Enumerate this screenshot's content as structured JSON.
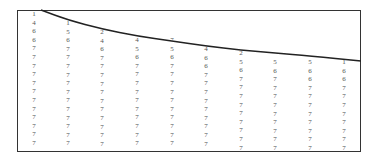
{
  "diagram": {
    "type": "number-grid-with-boundary-curve",
    "frame": {
      "left": 17,
      "top": 10,
      "right": 361,
      "bottom": 152
    },
    "curve_points": [
      [
        41,
        10
      ],
      [
        68,
        20
      ],
      [
        102,
        29
      ],
      [
        137,
        36
      ],
      [
        172,
        41
      ],
      [
        206,
        46
      ],
      [
        241,
        50
      ],
      [
        275,
        53
      ],
      [
        310,
        56
      ],
      [
        361,
        61
      ]
    ],
    "row_spacing": 8.6,
    "columns": [
      {
        "x": 34,
        "start_y": 14,
        "values": [
          "1",
          "4",
          "6",
          "6",
          "7",
          "7",
          "7",
          "7",
          "7",
          "7",
          "7",
          "7",
          "7",
          "7",
          "7",
          "7"
        ]
      },
      {
        "x": 68,
        "start_y": 23,
        "values": [
          "1",
          "5",
          "6",
          "7",
          "7",
          "7",
          "7",
          "7",
          "7",
          "7",
          "7",
          "7",
          "7",
          "7",
          "7"
        ]
      },
      {
        "x": 102,
        "start_y": 32,
        "values": [
          "2",
          "4",
          "6",
          "7",
          "7",
          "7",
          "7",
          "7",
          "7",
          "7",
          "7",
          "7",
          "7",
          "7"
        ]
      },
      {
        "x": 137,
        "start_y": 40,
        "values": [
          "4",
          "5",
          "6",
          "7",
          "7",
          "7",
          "7",
          "7",
          "7",
          "7",
          "7",
          "7",
          "7"
        ]
      },
      {
        "x": 172,
        "start_y": 40,
        "values": [
          "7",
          "5",
          "6",
          "7",
          "7",
          "7",
          "7",
          "7",
          "7",
          "7",
          "7",
          "7",
          "7"
        ]
      },
      {
        "x": 206,
        "start_y": 49,
        "values": [
          "4",
          "6",
          "6",
          "7",
          "7",
          "7",
          "7",
          "7",
          "7",
          "7",
          "7",
          "7"
        ]
      },
      {
        "x": 241,
        "start_y": 53,
        "values": [
          "2",
          "5",
          "6",
          "7",
          "7",
          "7",
          "7",
          "7",
          "7",
          "7",
          "7",
          "7"
        ]
      },
      {
        "x": 275,
        "start_y": 62,
        "values": [
          "5",
          "6",
          "7",
          "7",
          "7",
          "7",
          "7",
          "7",
          "7",
          "7",
          "7"
        ]
      },
      {
        "x": 310,
        "start_y": 62,
        "values": [
          "5",
          "6",
          "6",
          "7",
          "7",
          "7",
          "7",
          "7",
          "7",
          "7",
          "7"
        ]
      },
      {
        "x": 344,
        "start_y": 62,
        "values": [
          "1",
          "6",
          "6",
          "7",
          "7",
          "7",
          "7",
          "7",
          "7",
          "7",
          "7"
        ]
      }
    ]
  }
}
